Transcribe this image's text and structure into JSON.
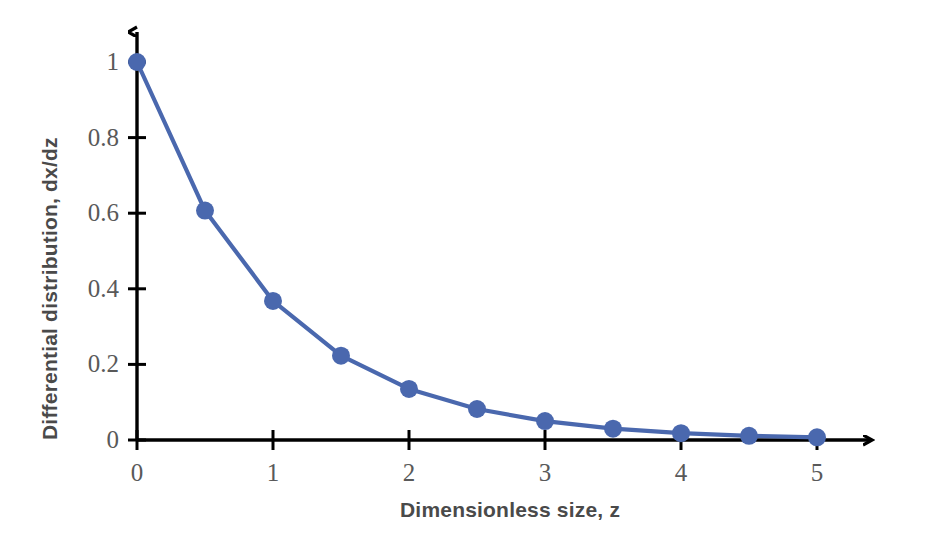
{
  "chart_data": {
    "type": "line",
    "title": "",
    "xlabel": "Dimensionless size, z",
    "ylabel": "Differential distribution, dx/dz",
    "x": [
      0,
      0.5,
      1,
      1.5,
      2,
      2.5,
      3,
      3.5,
      4,
      4.5,
      5
    ],
    "values": [
      1,
      0.607,
      0.368,
      0.223,
      0.135,
      0.082,
      0.05,
      0.03,
      0.018,
      0.011,
      0.007
    ],
    "series": [
      {
        "name": "dx/dz",
        "values": [
          1,
          0.607,
          0.368,
          0.223,
          0.135,
          0.082,
          0.05,
          0.03,
          0.018,
          0.011,
          0.007
        ]
      }
    ],
    "xlim": [
      0,
      5.5
    ],
    "ylim": [
      0,
      1.08
    ],
    "xticks": [
      0,
      1,
      2,
      3,
      4,
      5
    ],
    "xtick_labels": [
      "0",
      "1",
      "2",
      "3",
      "4",
      "5"
    ],
    "yticks": [
      0,
      0.2,
      0.4,
      0.6,
      0.8,
      1
    ],
    "ytick_labels": [
      "0",
      "0.2",
      "0.4",
      "0.6",
      "0.8",
      "1"
    ],
    "grid": false,
    "legend": "none",
    "marker": "circle",
    "line_color": "#4a68ae",
    "marker_color": "#4a68ae",
    "axis_color": "#000000",
    "tick_label_color": "#595959",
    "axis_title_color": "#4a4a4a",
    "background": "#ffffff"
  },
  "axes": {
    "x_title": "Dimensionless size, z",
    "y_title": "Differential distribution, dx/dz"
  },
  "ticks": {
    "y": [
      "1",
      "0.8",
      "0.6",
      "0.4",
      "0.2",
      "0"
    ],
    "x": [
      "0",
      "1",
      "2",
      "3",
      "4",
      "5"
    ]
  }
}
